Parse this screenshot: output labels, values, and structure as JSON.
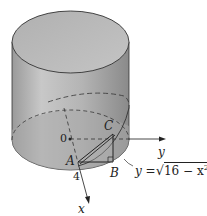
{
  "figure": {
    "type": "cylinder-wedge",
    "labels": {
      "origin": "0",
      "x_axis": "x",
      "y_axis": "y",
      "radius": "4",
      "point_a": "A",
      "point_b": "B",
      "point_c": "C",
      "equation_lhs": "y =",
      "equation_radicand": "16 − x",
      "equation_exponent": "2"
    },
    "colors": {
      "cylinder_side_light": "#c4c4c4",
      "cylinder_side_dark": "#8e8e8e",
      "cylinder_top": "#b8b8b8",
      "base_shade": "#a6a6a6",
      "stroke": "#333333"
    }
  }
}
